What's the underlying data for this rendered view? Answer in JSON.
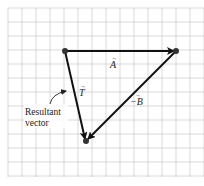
{
  "diagram": {
    "type": "vector-addition-triangle",
    "grid": {
      "x0": 8,
      "y0": 8,
      "x1": 204,
      "y1": 177,
      "spacing": 14,
      "color": "#c8c8c8"
    },
    "points": {
      "start": {
        "x": 65,
        "y": 51
      },
      "right": {
        "x": 176,
        "y": 51
      },
      "bottom": {
        "x": 86,
        "y": 141
      }
    },
    "vectors": [
      {
        "id": "A",
        "from": "start",
        "to": "right",
        "label": "A",
        "arrow": "→",
        "label_pos": {
          "x": 110,
          "y": 68
        }
      },
      {
        "id": "negB",
        "from": "right",
        "to": "bottom",
        "label": "−B",
        "arrow": "→",
        "label_pos": {
          "x": 131,
          "y": 104
        }
      },
      {
        "id": "T",
        "from": "start",
        "to": "bottom",
        "label": "T",
        "arrow": "→",
        "label_pos": {
          "x": 78,
          "y": 95
        }
      }
    ],
    "annotation": {
      "line1": "Resultant",
      "line2": "vector",
      "points_to": "T"
    },
    "colors": {
      "vector": "#111111",
      "dot": "#333333",
      "text": "#222222"
    }
  }
}
